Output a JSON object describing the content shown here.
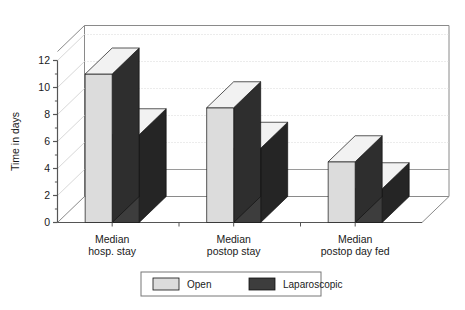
{
  "chart_data": {
    "type": "bar",
    "title": "",
    "subtitle": "",
    "xlabel": "",
    "ylabel": "Time in days",
    "categories": [
      "Median hosp. stay",
      "Median postop stay",
      "Median postop day fed"
    ],
    "category_lines": [
      [
        "Median",
        "hosp. stay"
      ],
      [
        "Median",
        "postop stay"
      ],
      [
        "Median",
        "postop day fed"
      ]
    ],
    "series": [
      {
        "name": "Open",
        "values": [
          11,
          8.5,
          4.5
        ],
        "color": "#dcdcdc"
      },
      {
        "name": "Laparoscopic",
        "values": [
          6.5,
          5.5,
          2.5
        ],
        "color": "#3d3d3d"
      }
    ],
    "ylim": [
      0,
      12
    ],
    "yticks": [
      0,
      2,
      4,
      6,
      8,
      10,
      12
    ],
    "ytick_labels": [
      "0",
      "2",
      "4",
      "6",
      "8",
      "10",
      "12"
    ],
    "grid": true,
    "grid_axis": "y",
    "legend_position": "bottom",
    "projection": "3d",
    "legend_entries": [
      {
        "label": "Open",
        "color": "#dcdcdc"
      },
      {
        "label": "Laparoscopic",
        "color": "#3d3d3d"
      }
    ]
  },
  "colors": {
    "open_front": "#dcdcdc",
    "open_top": "#f2f2f2",
    "open_side": "#2e2e2e",
    "lap_front": "#3d3d3d",
    "lap_top": "#f2f2f2",
    "lap_side": "#252525",
    "axis": "#555555",
    "grid": "#d8d8d8",
    "frame": "#8a8a8a",
    "text": "#1a1a1a",
    "legend_border": "#777777",
    "background": "#ffffff"
  }
}
